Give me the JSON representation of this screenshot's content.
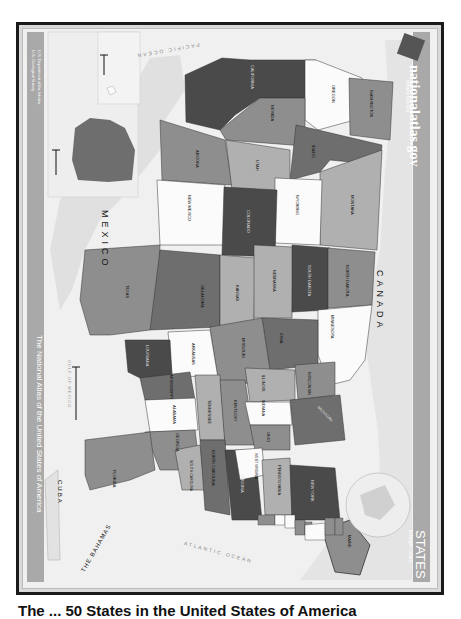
{
  "map": {
    "title": "STATES",
    "subtitle": "in bright colors",
    "brand": "nationalatlas.gov",
    "brand_tagline": "Where We Are",
    "side_banner": "The National Atlas of the United States of America",
    "agency_lines": [
      "U.S. Department of the Interior",
      "U.S. Geological Survey"
    ],
    "orientation": "rotated 90° clockwise (north points right)",
    "palette": {
      "frame": "#1a1a1a",
      "ocean": "#ececec",
      "land_foreign": "#e2e2e2",
      "sidebar": "#a9a9a9",
      "dark": "#4a4a4a",
      "mid_dark": "#6e6e6e",
      "mid": "#8e8e8e",
      "light": "#b0b0b0",
      "white": "#fbfbfb"
    },
    "water_labels": [
      "PACIFIC OCEAN",
      "ATLANTIC OCEAN",
      "GULF OF MEXICO"
    ],
    "country_labels": [
      "CANADA",
      "MEXICO",
      "CUBA",
      "THE BAHAMAS"
    ],
    "inset_labels": [
      "ALASKA",
      "HAWAII",
      "CANADA"
    ],
    "states": [
      {
        "name": "CALIFORNIA",
        "shade": "dark"
      },
      {
        "name": "OREGON",
        "shade": "white"
      },
      {
        "name": "WASHINGTON",
        "shade": "mid"
      },
      {
        "name": "NEVADA",
        "shade": "mid"
      },
      {
        "name": "IDAHO",
        "shade": "mid_dark"
      },
      {
        "name": "ARIZONA",
        "shade": "mid"
      },
      {
        "name": "UTAH",
        "shade": "light"
      },
      {
        "name": "MONTANA",
        "shade": "light"
      },
      {
        "name": "WYOMING",
        "shade": "white"
      },
      {
        "name": "NEW MEXICO",
        "shade": "white"
      },
      {
        "name": "COLORADO",
        "shade": "dark"
      },
      {
        "name": "TEXAS",
        "shade": "mid"
      },
      {
        "name": "OKLAHOMA",
        "shade": "mid_dark"
      },
      {
        "name": "KANSAS",
        "shade": "light"
      },
      {
        "name": "NEBRASKA",
        "shade": "light"
      },
      {
        "name": "SOUTH DAKOTA",
        "shade": "dark"
      },
      {
        "name": "NORTH DAKOTA",
        "shade": "mid"
      },
      {
        "name": "MINNESOTA",
        "shade": "white"
      },
      {
        "name": "IOWA",
        "shade": "mid_dark"
      },
      {
        "name": "MISSOURI",
        "shade": "mid"
      },
      {
        "name": "ARKANSAS",
        "shade": "white"
      },
      {
        "name": "LOUISIANA",
        "shade": "dark"
      },
      {
        "name": "MISSISSIPPI",
        "shade": "mid_dark"
      },
      {
        "name": "ALABAMA",
        "shade": "white"
      },
      {
        "name": "TENNESSEE",
        "shade": "light"
      },
      {
        "name": "KENTUCKY",
        "shade": "mid"
      },
      {
        "name": "ILLINOIS",
        "shade": "light"
      },
      {
        "name": "WISCONSIN",
        "shade": "mid"
      },
      {
        "name": "MICHIGAN",
        "shade": "mid_dark"
      },
      {
        "name": "INDIANA",
        "shade": "white"
      },
      {
        "name": "OHIO",
        "shade": "mid"
      },
      {
        "name": "GEORGIA",
        "shade": "mid"
      },
      {
        "name": "FLORIDA",
        "shade": "mid"
      },
      {
        "name": "SOUTH CAROLINA",
        "shade": "light"
      },
      {
        "name": "NORTH CAROLINA",
        "shade": "mid_dark"
      },
      {
        "name": "VIRGINIA",
        "shade": "dark"
      },
      {
        "name": "WEST VIRGINIA",
        "shade": "white"
      },
      {
        "name": "PENNSYLVANIA",
        "shade": "light"
      },
      {
        "name": "NEW YORK",
        "shade": "dark"
      },
      {
        "name": "MAINE",
        "shade": "mid"
      },
      {
        "name": "MARYLAND",
        "shade": "mid"
      },
      {
        "name": "DELAWARE",
        "shade": "white"
      },
      {
        "name": "NEW JERSEY",
        "shade": "white"
      },
      {
        "name": "CONNECTICUT",
        "shade": "mid"
      },
      {
        "name": "RHODE ISLAND",
        "shade": "mid"
      },
      {
        "name": "MASSACHUSETTS",
        "shade": "white"
      },
      {
        "name": "VERMONT",
        "shade": "mid"
      },
      {
        "name": "NEW HAMPSHIRE",
        "shade": "mid"
      },
      {
        "name": "ALASKA",
        "shade": "mid_dark"
      },
      {
        "name": "HAWAII",
        "shade": "white"
      }
    ],
    "caption_partial": "The ... 50 States in the United States of America"
  }
}
